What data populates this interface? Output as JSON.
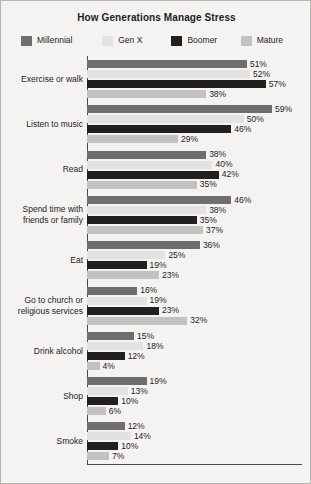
{
  "chart_data": {
    "type": "bar",
    "orientation": "horizontal",
    "title": "How Generations Manage Stress",
    "xlabel": "",
    "ylabel": "",
    "xlim": [
      0,
      59
    ],
    "grid": false,
    "legend_position": "top",
    "value_suffix": "%",
    "categories": [
      "Exercise or walk",
      "Listen to music",
      "Read",
      "Spend time with friends or family",
      "Eat",
      "Go to church or religious services",
      "Drink alcohol",
      "Shop",
      "Smoke"
    ],
    "series": [
      {
        "name": "Millennial",
        "color": "#6e6e6e",
        "values": [
          51,
          59,
          38,
          46,
          36,
          16,
          15,
          19,
          12
        ]
      },
      {
        "name": "Gen X",
        "color": "#e2e2e0",
        "values": [
          52,
          50,
          40,
          38,
          25,
          19,
          18,
          13,
          14
        ]
      },
      {
        "name": "Boomer",
        "color": "#221f1f",
        "values": [
          57,
          46,
          42,
          35,
          19,
          23,
          12,
          10,
          10
        ]
      },
      {
        "name": "Mature",
        "color": "#c2c2c0",
        "values": [
          38,
          29,
          35,
          37,
          23,
          32,
          4,
          6,
          7
        ]
      }
    ],
    "value_labels": [
      [
        "51%",
        "52%",
        "57%",
        "38%"
      ],
      [
        "59%",
        "50%",
        "46%",
        "29%"
      ],
      [
        "38%",
        "40%",
        "42%",
        "35%"
      ],
      [
        "46%",
        "38%",
        "35%",
        "37%"
      ],
      [
        "36%",
        "25%",
        "19%",
        "23%"
      ],
      [
        "16%",
        "19%",
        "23%",
        "32%"
      ],
      [
        "15%",
        "18%",
        "12%",
        "4%"
      ],
      [
        "19%",
        "13%",
        "10%",
        "6%"
      ],
      [
        "12%",
        "14%",
        "10%",
        "7%"
      ]
    ],
    "category_label_lines": [
      [
        "Exercise or walk"
      ],
      [
        "Listen to music"
      ],
      [
        "Read"
      ],
      [
        "Spend time with",
        "friends or family"
      ],
      [
        "Eat"
      ],
      [
        "Go to church or",
        "religious services"
      ],
      [
        "Drink alcohol"
      ],
      [
        "Shop"
      ],
      [
        "Smoke"
      ]
    ]
  },
  "legend": {
    "items": [
      {
        "label": "Millennial",
        "color": "#6e6e6e"
      },
      {
        "label": "Gen X",
        "color": "#e2e2e0"
      },
      {
        "label": "Boomer",
        "color": "#221f1f"
      },
      {
        "label": "Mature",
        "color": "#c2c2c0"
      }
    ]
  },
  "colors": {
    "background": "#f4f3f1",
    "border": "#b8b6b2",
    "axis": "#4a4a4a",
    "text": "#1d1d1d"
  }
}
